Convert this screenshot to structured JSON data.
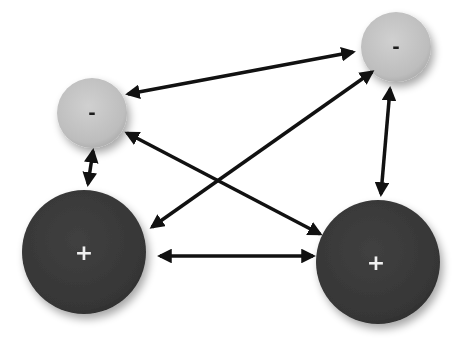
{
  "diagram": {
    "type": "charge-interaction",
    "background": "#ffffff",
    "nodes": [
      {
        "id": "neg-left",
        "label": "-",
        "charge": "negative",
        "cx": 92,
        "cy": 113,
        "r": 35,
        "fill": "#c8c8c8",
        "text_color": "#1a1a1a"
      },
      {
        "id": "neg-right",
        "label": "-",
        "charge": "negative",
        "cx": 396,
        "cy": 47,
        "r": 35,
        "fill": "#c8c8c8",
        "text_color": "#1a1a1a"
      },
      {
        "id": "pos-left",
        "label": "+",
        "charge": "positive",
        "cx": 84,
        "cy": 252,
        "r": 62,
        "fill": "#3a3a3a",
        "text_color": "#f0f0f0"
      },
      {
        "id": "pos-right",
        "label": "+",
        "charge": "positive",
        "cx": 378,
        "cy": 262,
        "r": 62,
        "fill": "#3a3a3a",
        "text_color": "#f0f0f0"
      }
    ],
    "edges": [
      {
        "from": "neg-left",
        "to": "neg-right",
        "bidirectional": true
      },
      {
        "from": "pos-left",
        "to": "neg-right",
        "bidirectional": true
      },
      {
        "from": "neg-left",
        "to": "pos-right",
        "bidirectional": true
      },
      {
        "from": "neg-left",
        "to": "pos-left",
        "bidirectional": true
      },
      {
        "from": "neg-right",
        "to": "pos-right",
        "bidirectional": true
      },
      {
        "from": "pos-left",
        "to": "pos-right",
        "bidirectional": true
      }
    ],
    "arrow_color": "#111111"
  }
}
